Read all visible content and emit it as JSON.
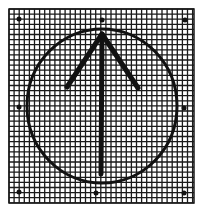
{
  "figure": {
    "background_color": "#ffffff",
    "ink_color": "#111111",
    "grid": {
      "x": 9,
      "y": 9,
      "width": 185,
      "height": 194,
      "cell": 5.1,
      "line_color": "#1a1a1a"
    },
    "circle": {
      "cx": 102,
      "cy": 106,
      "rx": 75,
      "ry": 77,
      "stroke_width": 3
    },
    "arrow": {
      "direction": "up",
      "tip": [
        102,
        34
      ],
      "tail": [
        101,
        174
      ],
      "left_arm": [
        67,
        87
      ],
      "right_arm": [
        138,
        88
      ],
      "stroke_width": 5
    },
    "dots": [
      {
        "name": "top-left",
        "x": 19,
        "y": 19
      },
      {
        "name": "top-center",
        "x": 102,
        "y": 20
      },
      {
        "name": "top-right",
        "x": 185,
        "y": 20
      },
      {
        "name": "middle-left",
        "x": 19,
        "y": 107
      },
      {
        "name": "middle-right",
        "x": 184,
        "y": 108
      },
      {
        "name": "bottom-left",
        "x": 19,
        "y": 192
      },
      {
        "name": "bottom-center",
        "x": 96,
        "y": 193
      },
      {
        "name": "bottom-right",
        "x": 184,
        "y": 193
      }
    ],
    "dot_radius": 2.5
  }
}
